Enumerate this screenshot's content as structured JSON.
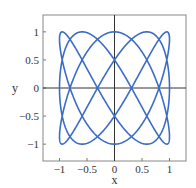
{
  "chart_data": {
    "type": "line",
    "title": "",
    "xlabel": "x",
    "ylabel": "y",
    "xlim": [
      -1.3,
      1.3
    ],
    "ylim": [
      -1.3,
      1.3
    ],
    "grid": false,
    "legend": null,
    "xticks": [
      -1,
      -0.5,
      0,
      0.5,
      1
    ],
    "yticks": [
      -1,
      -0.5,
      0,
      0.5,
      1
    ],
    "xtick_labels": [
      "−1",
      "−0.5",
      "0",
      "0.5",
      "1"
    ],
    "ytick_labels": [
      "−1",
      "−0.5",
      "0",
      "0.5",
      "1"
    ],
    "series": [
      {
        "name": "lissajous",
        "parametric": "x = sin(3t), y = cos(5t), t in [0, 2π]",
        "x_freq": 3,
        "y_freq": 5,
        "color": "#3a6cc8"
      }
    ],
    "zero_axes": true,
    "frame_color": "#888888",
    "axis_color": "#333333"
  }
}
